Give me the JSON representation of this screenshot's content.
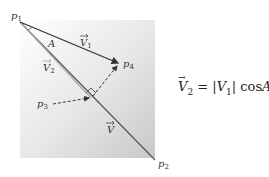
{
  "diagram": {
    "points": [
      {
        "id": "p1",
        "label": "p",
        "sub": "1"
      },
      {
        "id": "p2",
        "label": "p",
        "sub": "2"
      },
      {
        "id": "p3",
        "label": "p",
        "sub": "3"
      },
      {
        "id": "p4",
        "label": "p",
        "sub": "4"
      }
    ],
    "vectors": [
      {
        "id": "V1",
        "label": "V",
        "sub": "1"
      },
      {
        "id": "V2",
        "label": "V",
        "sub": "2"
      },
      {
        "id": "V",
        "label": "V",
        "sub": ""
      }
    ],
    "angle_label": "A",
    "equation": {
      "lhs": "V",
      "lhs_sub": "2",
      "equals": " = |",
      "rhs_v": "V",
      "rhs_sub": "1",
      "rhs_rest": "| cos",
      "rhs_angle": "A"
    }
  }
}
